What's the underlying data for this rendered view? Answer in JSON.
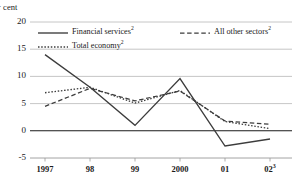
{
  "chart_data": {
    "type": "line",
    "title": "",
    "subtitle": "",
    "xlabel": "",
    "ylabel": "Per cent",
    "ylabel_visible": "er cent",
    "x": [
      "1997",
      "98",
      "99",
      "2000",
      "01",
      "02"
    ],
    "x_tick_labels": [
      "1997",
      "98",
      "99",
      "2000",
      "01",
      "02"
    ],
    "x_tick_superscripts": [
      "",
      "",
      "",
      "",
      "",
      "3"
    ],
    "y_tick_labels": [
      "20",
      "15",
      "10",
      "5",
      "0",
      "-5"
    ],
    "y_tick_values": [
      20,
      15,
      10,
      5,
      0,
      -5
    ],
    "ylim": [
      -5,
      20
    ],
    "grid": true,
    "grid_axis": "y",
    "zero_line": true,
    "legend_position": "top-inside",
    "series": [
      {
        "name": "Financial services",
        "superscript": "2",
        "style": "solid",
        "color": "#3c3c3c",
        "values": [
          14.0,
          8.0,
          1.0,
          9.6,
          -2.8,
          -1.5
        ]
      },
      {
        "name": "All other sectors",
        "superscript": "2",
        "style": "dashed",
        "color": "#3c3c3c",
        "values": [
          4.5,
          7.8,
          5.5,
          7.3,
          1.8,
          1.2
        ]
      },
      {
        "name": "Total economy",
        "superscript": "2",
        "style": "dotted",
        "color": "#3c3c3c",
        "values": [
          7.0,
          8.0,
          5.1,
          7.4,
          1.7,
          0.4
        ]
      }
    ]
  },
  "legend": {
    "items": [
      {
        "label": "Financial services",
        "superscript": "2",
        "style": "solid"
      },
      {
        "label": "All other sectors",
        "superscript": "2",
        "style": "dashed"
      },
      {
        "label": "Total economy",
        "superscript": "2",
        "style": "dotted"
      }
    ]
  },
  "colors": {
    "line": "#3c3c3c",
    "grid": "#b8b8b8",
    "axis": "#1a1a1a",
    "text": "#1a1a1a",
    "background": "#ffffff"
  }
}
